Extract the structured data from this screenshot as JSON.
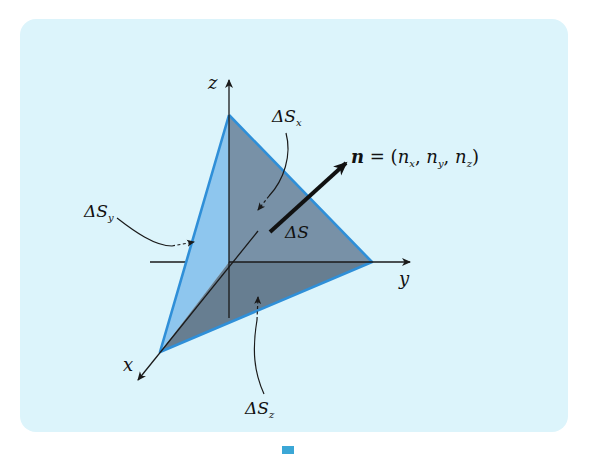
{
  "figure": {
    "colors": {
      "panel_background": "#dcf4fb",
      "face_light": "#8ec6ee",
      "face_dark": "#6e879f",
      "face_dark_lower": "#5f7589",
      "edge_blue": "#2f8fd8",
      "axis": "#1a1a1a",
      "marker": "#3ba7d6"
    },
    "axes": {
      "x": "x",
      "y": "y",
      "z": "z"
    },
    "labels": {
      "delta_sx": {
        "base": "ΔS",
        "sub": "x"
      },
      "delta_sy": {
        "base": "ΔS",
        "sub": "y"
      },
      "delta_sz": {
        "base": "ΔS",
        "sub": "z"
      },
      "delta_s": "ΔS",
      "normal": {
        "symbol": "n",
        "equals": " = (",
        "nx": "n",
        "nx_sub": "x",
        "sep1": ", ",
        "ny": "n",
        "ny_sub": "y",
        "sep2": ", ",
        "nz": "n",
        "nz_sub": "z",
        "close": ")"
      }
    }
  }
}
